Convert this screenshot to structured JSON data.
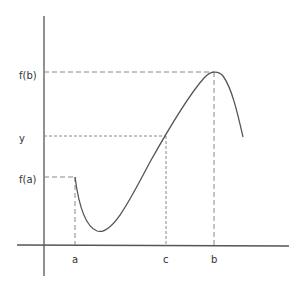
{
  "diagram": {
    "labels": {
      "y_axis": [
        "f(b)",
        "y",
        "f(a)"
      ],
      "x_axis": [
        "a",
        "c",
        "b"
      ],
      "fb": "f(b)",
      "y": "y",
      "fa": "f(a)",
      "a": "a",
      "c": "c",
      "b": "b"
    },
    "colors": {
      "axis": "#555555",
      "curve": "#555555",
      "guide": "#888888",
      "text": "#333333"
    },
    "points": {
      "a": {
        "x": 75,
        "y": 177
      },
      "min": {
        "x": 97,
        "y": 231
      },
      "c": {
        "x": 166,
        "y": 136
      },
      "b": {
        "x": 214,
        "y": 72
      },
      "end": {
        "x": 243,
        "y": 137
      }
    }
  }
}
